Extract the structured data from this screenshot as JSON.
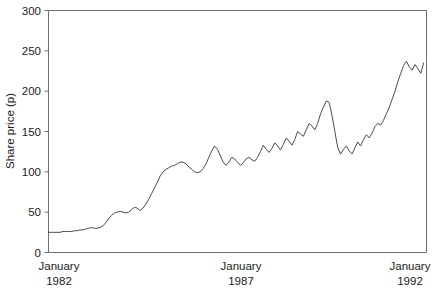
{
  "chart_data": {
    "type": "line",
    "title": "",
    "subtitle": "",
    "xlabel": "",
    "ylabel": "Share price (p)",
    "ylim": [
      0,
      300
    ],
    "yticks": [
      0,
      50,
      100,
      150,
      200,
      250,
      300
    ],
    "ytick_labels": [
      "0",
      "50",
      "100",
      "150",
      "200",
      "250",
      "300"
    ],
    "grid": false,
    "legend": false,
    "legend_position": "none",
    "xlim": [
      0,
      132
    ],
    "xticks": [
      0,
      60,
      120
    ],
    "xtick_labels": [
      {
        "line1": "January",
        "line2": "1982"
      },
      {
        "line1": "January",
        "line2": "1987"
      },
      {
        "line1": "January",
        "line2": "1992"
      }
    ],
    "x_unit": "months since January 1982",
    "series": [
      {
        "name": "Share price",
        "color": "#4a4a4a",
        "x": [
          0,
          1,
          2,
          3,
          4,
          5,
          6,
          7,
          8,
          9,
          10,
          11,
          12,
          13,
          14,
          15,
          16,
          17,
          18,
          19,
          20,
          21,
          22,
          23,
          24,
          25,
          26,
          27,
          28,
          29,
          30,
          31,
          32,
          33,
          34,
          35,
          36,
          37,
          38,
          39,
          40,
          41,
          42,
          43,
          44,
          45,
          46,
          47,
          48,
          49,
          50,
          51,
          52,
          53,
          54,
          55,
          56,
          57,
          58,
          59,
          60,
          61,
          62,
          63,
          64,
          65,
          66,
          67,
          68,
          69,
          70,
          71,
          72,
          73,
          74,
          75,
          76,
          77,
          78,
          79,
          80,
          81,
          82,
          83,
          84,
          85,
          86,
          87,
          88,
          89,
          90,
          91,
          92,
          93,
          94,
          95,
          96,
          97,
          98,
          99,
          100,
          101,
          102,
          103,
          104,
          105,
          106,
          107,
          108,
          109,
          110,
          111,
          112,
          113,
          114,
          115,
          116,
          117,
          118,
          119,
          120,
          121,
          122,
          123,
          124,
          125,
          126,
          127,
          128,
          129,
          130,
          131
        ],
        "values": [
          25,
          25,
          25,
          25,
          25,
          26,
          26,
          26,
          26,
          27,
          27,
          28,
          28,
          29,
          30,
          31,
          30,
          30,
          31,
          33,
          37,
          42,
          46,
          49,
          50,
          51,
          50,
          49,
          50,
          53,
          56,
          55,
          52,
          55,
          60,
          66,
          73,
          80,
          87,
          95,
          100,
          103,
          105,
          107,
          108,
          110,
          112,
          112,
          110,
          106,
          103,
          100,
          99,
          100,
          104,
          110,
          118,
          126,
          132,
          128,
          120,
          112,
          108,
          112,
          118,
          116,
          112,
          108,
          111,
          116,
          118,
          115,
          113,
          118,
          125,
          133,
          128,
          124,
          129,
          136,
          132,
          127,
          134,
          142,
          138,
          133,
          140,
          150,
          147,
          144,
          152,
          160,
          157,
          152,
          160,
          172,
          180,
          188,
          186,
          170,
          150,
          130,
          122,
          128,
          132,
          126,
          122,
          130,
          137,
          132,
          140,
          146,
          142,
          148,
          156,
          160,
          158,
          164,
          172,
          180,
          190,
          200,
          212,
          222,
          232,
          237,
          230,
          226,
          233,
          228,
          222,
          235
        ]
      }
    ],
    "annotations": []
  },
  "axes": {
    "ylabel": "Share price (p)",
    "ytick_labels": [
      "300",
      "250",
      "200",
      "150",
      "100",
      "50",
      "0"
    ],
    "xtick_rows": [
      {
        "line1": "January",
        "line2": "1982"
      },
      {
        "line1": "January",
        "line2": "1987"
      },
      {
        "line1": "January",
        "line2": "1992"
      }
    ]
  },
  "colors": {
    "series": "#4a4a4a",
    "frame": "#6e6e6e",
    "text": "#1a1a1a",
    "background": "#ffffff"
  }
}
